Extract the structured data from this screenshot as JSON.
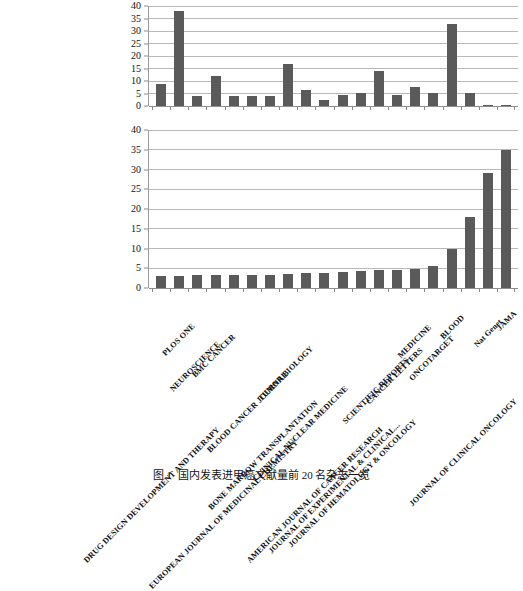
{
  "caption": {
    "number": "图 1",
    "text": "国内发表进甲癌文献量前 20 名杂志一览"
  },
  "categories": [
    "DRUG DESIGN DEVELOPMENT AND THERAPY",
    "PLOS ONE",
    "NEUROSCIENCE",
    "BMC CANCER",
    "EUROPEAN JOURNAL OF MEDICINAL CHEMISTRY",
    "BLOOD CANCER JOURNAL",
    "BONE MARROW TRANSPLANTATION",
    "TUMOR BIOLOGY",
    "CLINICAL NUCLEAR MEDICINE",
    "AMERICAN JOURNAL OF CANCER RESEARCH",
    "JOURNAL OF EXPERIMENTAL & CLINICAL...",
    "JOURNAL OF HEMATOLOGY & ONCOLOGY",
    "SCIENTIFIC REPORTS",
    "CANCER LETTERS",
    "MEDICINE",
    "ONCOTARGET",
    "BLOOD",
    "JOURNAL OF CLINICAL ONCOLOGY",
    "Nat Genet",
    "JAMA"
  ],
  "chart_data": [
    {
      "type": "bar",
      "id": "chart-top",
      "title": "",
      "xlabel": "",
      "ylabel": "",
      "ylim": [
        0,
        40
      ],
      "yticks": [
        0,
        5,
        10,
        15,
        20,
        25,
        30,
        35,
        40
      ],
      "grid": true,
      "legend": "none",
      "bar_color": "#5a5a5a",
      "categories": [
        "DRUG DESIGN DEVELOPMENT AND THERAPY",
        "PLOS ONE",
        "NEUROSCIENCE",
        "BMC CANCER",
        "EUROPEAN JOURNAL OF MEDICINAL CHEMISTRY",
        "BLOOD CANCER JOURNAL",
        "BONE MARROW TRANSPLANTATION",
        "TUMOR BIOLOGY",
        "CLINICAL NUCLEAR MEDICINE",
        "AMERICAN JOURNAL OF CANCER RESEARCH",
        "JOURNAL OF EXPERIMENTAL & CLINICAL...",
        "JOURNAL OF HEMATOLOGY & ONCOLOGY",
        "SCIENTIFIC REPORTS",
        "CANCER LETTERS",
        "MEDICINE",
        "ONCOTARGET",
        "BLOOD",
        "JOURNAL OF CLINICAL ONCOLOGY",
        "Nat Genet",
        "JAMA"
      ],
      "values": [
        9,
        38,
        4,
        12,
        4,
        4,
        4,
        17,
        6.5,
        2.5,
        4.5,
        5.2,
        14,
        4.5,
        7.5,
        5.2,
        33,
        5.2,
        0.5,
        0.5
      ]
    },
    {
      "type": "bar",
      "id": "chart-bottom",
      "title": "",
      "xlabel": "",
      "ylabel": "",
      "ylim": [
        0,
        40
      ],
      "yticks": [
        0,
        5,
        10,
        15,
        20,
        25,
        30,
        35,
        40
      ],
      "grid": true,
      "legend": "none",
      "bar_color": "#5a5a5a",
      "categories": [
        "DRUG DESIGN DEVELOPMENT AND THERAPY",
        "PLOS ONE",
        "NEUROSCIENCE",
        "BMC CANCER",
        "EUROPEAN JOURNAL OF MEDICINAL CHEMISTRY",
        "BLOOD CANCER JOURNAL",
        "BONE MARROW TRANSPLANTATION",
        "TUMOR BIOLOGY",
        "CLINICAL NUCLEAR MEDICINE",
        "AMERICAN JOURNAL OF CANCER RESEARCH",
        "JOURNAL OF EXPERIMENTAL & CLINICAL...",
        "JOURNAL OF HEMATOLOGY & ONCOLOGY",
        "SCIENTIFIC REPORTS",
        "CANCER LETTERS",
        "MEDICINE",
        "ONCOTARGET",
        "BLOOD",
        "JOURNAL OF CLINICAL ONCOLOGY",
        "Nat Genet",
        "JAMA"
      ],
      "values": [
        3,
        3,
        3.2,
        3.3,
        3.2,
        3.4,
        3.4,
        3.5,
        3.7,
        3.8,
        4,
        4.3,
        4.5,
        4.6,
        4.8,
        5.5,
        10,
        18,
        29,
        35
      ]
    }
  ]
}
